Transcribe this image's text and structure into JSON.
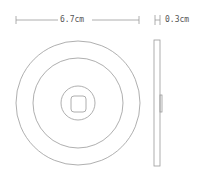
{
  "diagram": {
    "width_label": "6.7cm",
    "thickness_label": "0.3cm",
    "stroke_color": "#9a9a9a",
    "text_color": "#555555",
    "front_view": {
      "center": [
        78,
        103
      ],
      "outer_radius": 62,
      "inner_radius": 45,
      "button_radius": 17,
      "square": {
        "x": 71,
        "y": 96,
        "w": 15,
        "h": 16,
        "corner": 3
      }
    },
    "side_view": {
      "x": 154,
      "y": 40,
      "w": 6,
      "h": 126,
      "bump": {
        "x": 160,
        "y": 95,
        "w": 2,
        "h": 17
      }
    }
  }
}
